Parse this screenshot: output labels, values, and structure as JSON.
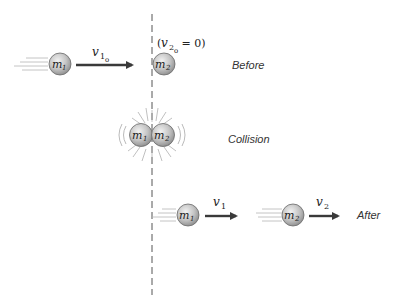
{
  "diagram": {
    "stages": {
      "before": {
        "label": "Before",
        "mass1": {
          "symbol": "m",
          "sub": "1"
        },
        "mass2": {
          "symbol": "m",
          "sub": "2"
        },
        "velocity1": {
          "symbol": "v",
          "sub": "1",
          "sub2": "o"
        },
        "condition": {
          "open": "(",
          "symbol": "v",
          "sub": "2",
          "sub2": "o",
          "rest": " = 0)"
        }
      },
      "collision": {
        "label": "Collision",
        "mass1": {
          "symbol": "m",
          "sub": "1"
        },
        "mass2": {
          "symbol": "m",
          "sub": "2"
        }
      },
      "after": {
        "label": "After",
        "mass1": {
          "symbol": "m",
          "sub": "1"
        },
        "mass2": {
          "symbol": "m",
          "sub": "2"
        },
        "velocity1": {
          "symbol": "v",
          "sub": "1"
        },
        "velocity2": {
          "symbol": "v",
          "sub": "2"
        }
      }
    },
    "colors": {
      "ball_light": "#e6e6e6",
      "ball_dark": "#8c8c8c",
      "ball_stroke": "#6a6a6a",
      "arrow": "#3a3a3a",
      "dashed_line": "#555555",
      "motion_lines": "#b5b5b5"
    }
  }
}
